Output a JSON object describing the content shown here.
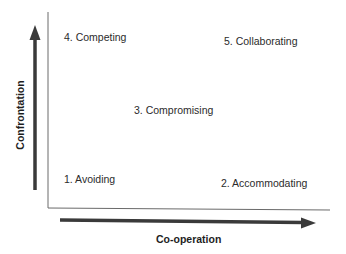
{
  "diagram": {
    "type": "quadrant-diagram",
    "x_axis": {
      "label": "Co-operation",
      "direction": "increasing-right"
    },
    "y_axis": {
      "label": "Confrontation",
      "direction": "increasing-up"
    },
    "styles": [
      {
        "id": 1,
        "label": "1. Avoiding",
        "position": "bottom-left"
      },
      {
        "id": 2,
        "label": "2. Accommodating",
        "position": "bottom-right"
      },
      {
        "id": 3,
        "label": "3. Compromising",
        "position": "center"
      },
      {
        "id": 4,
        "label": "4. Competing",
        "position": "top-left"
      },
      {
        "id": 5,
        "label": "5. Collaborating",
        "position": "top-right"
      }
    ],
    "colors": {
      "arrow": "#3a3a3a",
      "axis_line": "#6a6a6a",
      "text": "#2b2b2b"
    }
  }
}
